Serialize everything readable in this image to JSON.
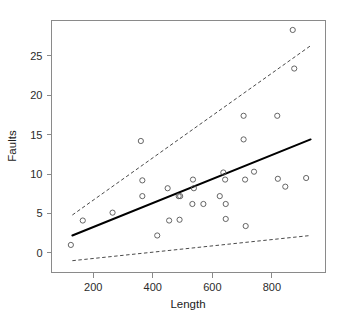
{
  "chart_data": {
    "type": "scatter",
    "title": "",
    "xlabel": "Length",
    "ylabel": "Faults",
    "xlim": [
      60,
      980
    ],
    "ylim": [
      -2.5,
      29.5
    ],
    "grid": false,
    "legend": false,
    "xticks": [
      200,
      400,
      600,
      800
    ],
    "yticks": [
      0,
      5,
      10,
      15,
      20,
      25
    ],
    "xtick_labels": [
      "200",
      "400",
      "600",
      "800"
    ],
    "ytick_labels": [
      "0",
      "5",
      "10",
      "15",
      "20",
      "25"
    ],
    "marker": "open-circle",
    "points": [
      {
        "x": 125,
        "y": 1.0
      },
      {
        "x": 165,
        "y": 4.1
      },
      {
        "x": 265,
        "y": 5.1
      },
      {
        "x": 360,
        "y": 14.2
      },
      {
        "x": 365,
        "y": 9.2
      },
      {
        "x": 365,
        "y": 7.2
      },
      {
        "x": 415,
        "y": 2.2
      },
      {
        "x": 450,
        "y": 8.2
      },
      {
        "x": 455,
        "y": 4.1
      },
      {
        "x": 490,
        "y": 4.2
      },
      {
        "x": 487,
        "y": 7.2
      },
      {
        "x": 492,
        "y": 7.2
      },
      {
        "x": 535,
        "y": 9.3
      },
      {
        "x": 538,
        "y": 8.2
      },
      {
        "x": 533,
        "y": 6.2
      },
      {
        "x": 570,
        "y": 6.2
      },
      {
        "x": 625,
        "y": 7.2
      },
      {
        "x": 637,
        "y": 10.2
      },
      {
        "x": 643,
        "y": 9.3
      },
      {
        "x": 645,
        "y": 6.2
      },
      {
        "x": 645,
        "y": 4.3
      },
      {
        "x": 705,
        "y": 17.4
      },
      {
        "x": 705,
        "y": 14.4
      },
      {
        "x": 710,
        "y": 9.3
      },
      {
        "x": 712,
        "y": 3.4
      },
      {
        "x": 740,
        "y": 10.3
      },
      {
        "x": 818,
        "y": 17.4
      },
      {
        "x": 820,
        "y": 9.4
      },
      {
        "x": 845,
        "y": 8.4
      },
      {
        "x": 870,
        "y": 28.3
      },
      {
        "x": 875,
        "y": 23.4
      },
      {
        "x": 915,
        "y": 9.5
      }
    ],
    "fit_line": {
      "name": "regression-fit",
      "style": "solid",
      "x": [
        130,
        930
      ],
      "y": [
        2.2,
        14.4
      ]
    },
    "bands": [
      {
        "name": "upper-prediction-band",
        "style": "dashed",
        "x": [
          130,
          930
        ],
        "y": [
          4.8,
          26.3
        ]
      },
      {
        "name": "lower-prediction-band",
        "style": "dashed",
        "x": [
          130,
          930
        ],
        "y": [
          -1.0,
          2.2
        ]
      }
    ]
  }
}
